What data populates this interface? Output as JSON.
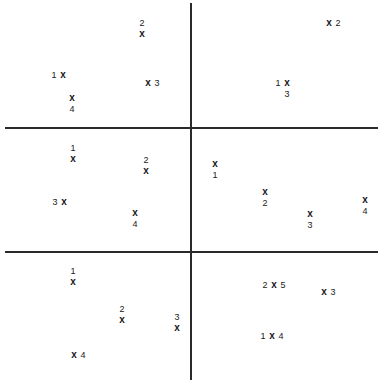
{
  "diagram": {
    "marker_symbol": "x",
    "lines": {
      "vertical_x": 190,
      "horizontal_y": [
        128,
        252
      ]
    },
    "panels": [
      {
        "name": "top-left",
        "points": [
          {
            "label": "2",
            "x": 142,
            "y": 34,
            "label_pos": "above"
          },
          {
            "label": "1",
            "x": 63,
            "y": 75,
            "label_pos": "left"
          },
          {
            "label": "3",
            "x": 148,
            "y": 83,
            "label_pos": "right"
          },
          {
            "label": "4",
            "x": 72,
            "y": 98,
            "label_pos": "below"
          }
        ]
      },
      {
        "name": "top-right",
        "points": [
          {
            "label": "2",
            "x": 329,
            "y": 23,
            "label_pos": "right"
          },
          {
            "label": "1",
            "x": 287,
            "y": 83,
            "label_pos": "left"
          },
          {
            "label": "3",
            "x": 287,
            "y": 83,
            "label_pos": "below"
          }
        ]
      },
      {
        "name": "middle-left",
        "points": [
          {
            "label": "1",
            "x": 73,
            "y": 159,
            "label_pos": "above"
          },
          {
            "label": "2",
            "x": 146,
            "y": 171,
            "label_pos": "above"
          },
          {
            "label": "3",
            "x": 64,
            "y": 202,
            "label_pos": "left"
          },
          {
            "label": "4",
            "x": 135,
            "y": 213,
            "label_pos": "below"
          }
        ]
      },
      {
        "name": "middle-right",
        "points": [
          {
            "label": "1",
            "x": 215,
            "y": 164,
            "label_pos": "below"
          },
          {
            "label": "2",
            "x": 265,
            "y": 192,
            "label_pos": "below"
          },
          {
            "label": "3",
            "x": 310,
            "y": 214,
            "label_pos": "below"
          },
          {
            "label": "4",
            "x": 365,
            "y": 200,
            "label_pos": "below"
          }
        ]
      },
      {
        "name": "bottom-left",
        "points": [
          {
            "label": "1",
            "x": 73,
            "y": 282,
            "label_pos": "above"
          },
          {
            "label": "2",
            "x": 122,
            "y": 320,
            "label_pos": "above"
          },
          {
            "label": "3",
            "x": 177,
            "y": 328,
            "label_pos": "above"
          },
          {
            "label": "4",
            "x": 74,
            "y": 355,
            "label_pos": "right"
          }
        ]
      },
      {
        "name": "bottom-right",
        "points": [
          {
            "label": "2",
            "x": 274,
            "y": 285,
            "label_pos": "left"
          },
          {
            "label": "5",
            "x": 274,
            "y": 285,
            "label_pos": "right"
          },
          {
            "label": "3",
            "x": 324,
            "y": 292,
            "label_pos": "right"
          },
          {
            "label": "1",
            "x": 272,
            "y": 336,
            "label_pos": "left"
          },
          {
            "label": "4",
            "x": 272,
            "y": 336,
            "label_pos": "right"
          }
        ]
      }
    ]
  }
}
